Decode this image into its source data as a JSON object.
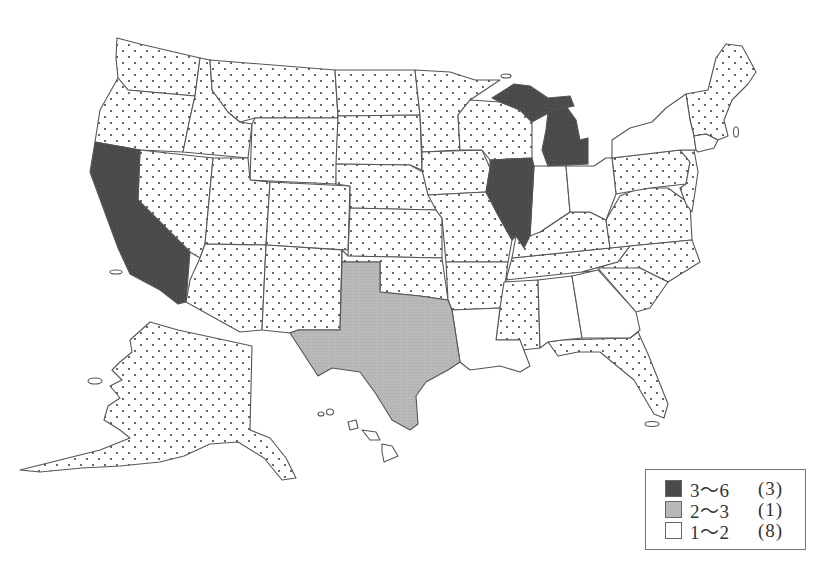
{
  "map": {
    "title": "",
    "region": "United States (by state)",
    "patterns": {
      "dark": "#4a4a4a",
      "grey": "#b8b8b8",
      "white": "#ffffff",
      "dotted": "dotted (unclassified)"
    },
    "classified_states": {
      "range_3_6": [
        "California",
        "Illinois",
        "Michigan"
      ],
      "range_2_3": [
        "Texas"
      ],
      "range_1_2": [
        "New York",
        "Indiana",
        "Ohio",
        "Alabama",
        "Georgia",
        "Louisiana",
        "Connecticut",
        "Hawaii"
      ]
    }
  },
  "legend": {
    "items": [
      {
        "range": "3〜6",
        "count": "(3)",
        "color": "#4a4a4a"
      },
      {
        "range": "2〜3",
        "count": "(1)",
        "color": "#b8b8b8"
      },
      {
        "range": "1〜2",
        "count": "(8)",
        "color": "#ffffff"
      }
    ]
  }
}
